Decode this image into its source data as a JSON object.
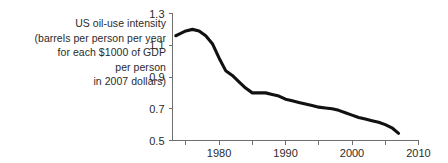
{
  "caption": {
    "lines": [
      "US oil-use intensity",
      "(barrels per person per year",
      "for each $1000 of GDP",
      "per person",
      "in 2007 dollars)"
    ]
  },
  "colors": {
    "line": "#111111",
    "axis": "#6e6e6e",
    "text": "#2b2b2b",
    "background": "#ffffff"
  },
  "chart_data": {
    "type": "line",
    "title": "",
    "subtitle": "",
    "xlabel": "",
    "ylabel": "US oil-use intensity (barrels per person per year for each $1000 of GDP per person in 2007 dollars)",
    "xlim": [
      1973,
      2010
    ],
    "ylim": [
      0.5,
      1.3
    ],
    "x_ticks": [
      1975,
      1980,
      1985,
      1990,
      1995,
      2000,
      2005,
      2010
    ],
    "x_tick_labels": [
      "",
      "1980",
      "",
      "1990",
      "",
      "2000",
      "",
      "2010"
    ],
    "y_ticks": [
      0.5,
      0.7,
      0.9,
      1.1,
      1.3
    ],
    "y_tick_labels": [
      "0.5",
      "0.7",
      "0.9",
      "1.1",
      "1.3"
    ],
    "grid": false,
    "legend": null,
    "series": [
      {
        "name": "US oil-use intensity",
        "x": [
          1973.5,
          1974,
          1975,
          1976,
          1977,
          1978,
          1979,
          1980,
          1981,
          1982,
          1983,
          1984,
          1985,
          1986,
          1987,
          1988,
          1989,
          1990,
          1991,
          1992,
          1993,
          1994,
          1995,
          1996,
          1997,
          1998,
          1999,
          2000,
          2001,
          2002,
          2003,
          2004,
          2005,
          2006,
          2007
        ],
        "y": [
          1.16,
          1.17,
          1.19,
          1.2,
          1.19,
          1.16,
          1.11,
          1.02,
          0.94,
          0.91,
          0.87,
          0.83,
          0.8,
          0.8,
          0.8,
          0.79,
          0.78,
          0.76,
          0.75,
          0.74,
          0.73,
          0.72,
          0.71,
          0.705,
          0.7,
          0.69,
          0.675,
          0.66,
          0.645,
          0.635,
          0.625,
          0.615,
          0.6,
          0.58,
          0.545
        ]
      }
    ]
  }
}
